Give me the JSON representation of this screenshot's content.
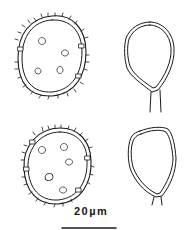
{
  "figure": {
    "panels": [
      {
        "position": "top-left",
        "type": "spinulose spore with pores"
      },
      {
        "position": "top-right",
        "type": "stalked teardrop cell"
      },
      {
        "position": "bottom-left",
        "type": "spinulose spore with pores"
      },
      {
        "position": "bottom-right",
        "type": "stalked teardrop cell"
      }
    ],
    "line_color": "#1a1a1a",
    "background": "#ffffff"
  },
  "scale_bar": {
    "label": "20µm"
  }
}
